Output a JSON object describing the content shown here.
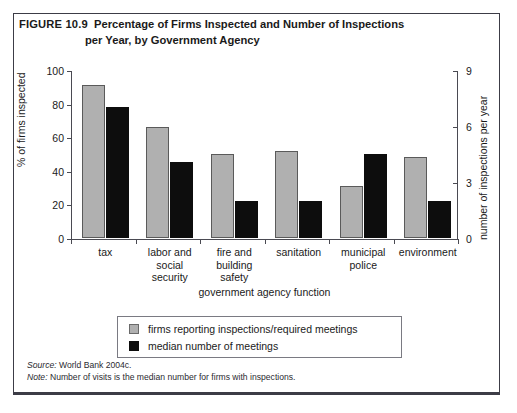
{
  "figure": {
    "number_label": "FIGURE 10.9",
    "title_line1": "Percentage of Firms Inspected and Number of Inspections",
    "title_line2": "per Year, by Government Agency"
  },
  "footnotes": {
    "source_key": "Source:",
    "source_text": " World Bank 2004c.",
    "note_key": "Note:",
    "note_text": " Number of visits is the median number for firms with inspections."
  },
  "legend": {
    "items": [
      {
        "label": "firms reporting inspections/required meetings",
        "color": "#b0b0b0",
        "swatch": "gray"
      },
      {
        "label": "median number of meetings",
        "color": "#0d0d0d",
        "swatch": "black"
      }
    ]
  },
  "chart_data": {
    "type": "bar",
    "title": "Percentage of Firms Inspected and Number of Inspections per Year, by Government Agency",
    "xlabel": "government agency function",
    "ylabel": "% of firms inspected",
    "y2label": "number of inspections per year",
    "categories": [
      "tax",
      "labor and social security",
      "fire and building safety",
      "sanitation",
      "municipal police",
      "environment"
    ],
    "category_label_lines": [
      [
        "tax"
      ],
      [
        "labor and",
        "social",
        "security"
      ],
      [
        "fire and",
        "building",
        "safety"
      ],
      [
        "sanitation"
      ],
      [
        "municipal",
        "police"
      ],
      [
        "environment"
      ]
    ],
    "series": [
      {
        "name": "firms reporting inspections/required meetings",
        "axis": "left",
        "unit": "%",
        "color": "#b0b0b0",
        "values": [
          91,
          66,
          50,
          52,
          31,
          48
        ]
      },
      {
        "name": "median number of meetings",
        "axis": "right",
        "unit": "inspections per year",
        "color": "#0d0d0d",
        "values": [
          7.0,
          4.0,
          2.0,
          2.0,
          4.5,
          2.0
        ],
        "values_on_left_scale": [
          78,
          45,
          22,
          22,
          50,
          22
        ]
      }
    ],
    "ylim": [
      0,
      100
    ],
    "yticks": [
      0,
      20,
      40,
      60,
      80,
      100
    ],
    "y2lim": [
      0,
      9
    ],
    "y2ticks": [
      0,
      3,
      6,
      9
    ],
    "grid": false,
    "legend_position": "below-plot"
  }
}
